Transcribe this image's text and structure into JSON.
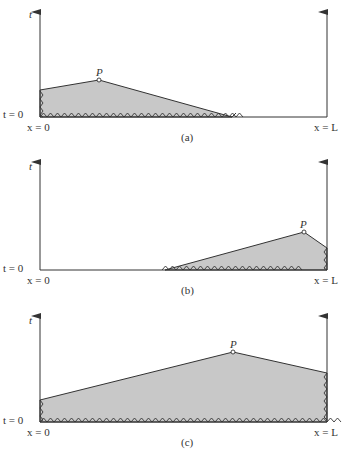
{
  "diagram": {
    "type": "space-time domain of dependence figure",
    "panels": [
      {
        "id": "a",
        "caption": "(a)",
        "axis_t_label": "t",
        "t0_label": "t = 0",
        "x0_label": "x = 0",
        "xL_label": "x = L",
        "point_label": "P",
        "description": "Shaded region bounded by left boundary x=0 and initial line t=0; P near the left boundary"
      },
      {
        "id": "b",
        "caption": "(b)",
        "axis_t_label": "t",
        "t0_label": "t = 0",
        "x0_label": "x = 0",
        "xL_label": "x = L",
        "point_label": "P",
        "description": "Shaded region bounded by right boundary x=L and initial line t=0; P near the right boundary"
      },
      {
        "id": "c",
        "caption": "(c)",
        "axis_t_label": "t",
        "t0_label": "t = 0",
        "x0_label": "x = 0",
        "xL_label": "x = L",
        "point_label": "P",
        "description": "Shaded region spanning entire interval, bounded by both boundaries and the initial line"
      }
    ],
    "colors": {
      "shading": "#c8c8c8",
      "lines": "#333333",
      "background": "#ffffff"
    }
  }
}
